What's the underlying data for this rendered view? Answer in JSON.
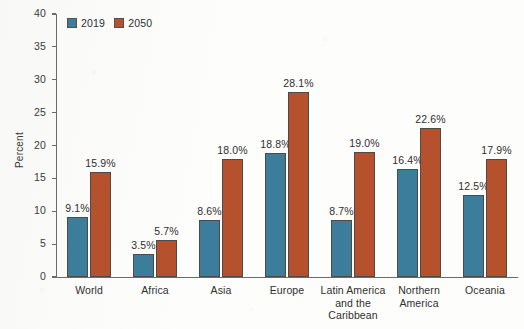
{
  "chart_data": {
    "type": "bar",
    "title": "",
    "subtitle": "",
    "xlabel": "",
    "ylabel": "Percent",
    "ylim": [
      0,
      40
    ],
    "yticks": [
      0,
      5,
      10,
      15,
      20,
      25,
      30,
      35,
      40
    ],
    "ytick_labels": [
      "0",
      "5",
      "10",
      "15",
      "20",
      "25",
      "30",
      "35",
      "40"
    ],
    "grid": false,
    "legend_position": "top-left",
    "value_label_suffix": "%",
    "categories": [
      "World",
      "Latin America and the Caribbean",
      "Africa",
      "Asia",
      "Europe",
      "Northern America",
      "Oceania"
    ],
    "category_display": [
      [
        "World"
      ],
      [
        "Africa"
      ],
      [
        "Asia"
      ],
      [
        "Europe"
      ],
      [
        "Latin America",
        "and the",
        "Caribbean"
      ],
      [
        "Northern",
        "America"
      ],
      [
        "Oceania"
      ]
    ],
    "category_order": [
      "World",
      "Africa",
      "Asia",
      "Europe",
      "Latin America and the Caribbean",
      "Northern America",
      "Oceania"
    ],
    "series": [
      {
        "name": "2019",
        "color": "#3d7d9c",
        "values": [
          9.1,
          3.5,
          8.6,
          18.8,
          8.7,
          16.4,
          12.5
        ],
        "labels": [
          "9.1%",
          "3.5%",
          "8.6%",
          "18.8%",
          "8.7%",
          "16.4%",
          "12.5%"
        ]
      },
      {
        "name": "2050",
        "color": "#b5512c",
        "values": [
          15.9,
          5.7,
          18.0,
          28.1,
          19.0,
          22.6,
          17.9
        ],
        "labels": [
          "15.9%",
          "5.7%",
          "18.0%",
          "28.1%",
          "19.0%",
          "22.6%",
          "17.9%"
        ]
      }
    ]
  },
  "legend": {
    "entries": [
      {
        "label": "2019",
        "color": "#3d7d9c"
      },
      {
        "label": "2050",
        "color": "#b5512c"
      }
    ]
  },
  "colors": {
    "series_2019": "#3d7d9c",
    "series_2050": "#b5512c",
    "axis": "#6b6b6b",
    "text": "#2f2f2f",
    "background": "#fdfdfc",
    "bar_outline": "#4d4a48"
  }
}
